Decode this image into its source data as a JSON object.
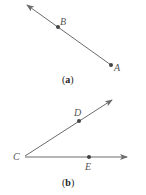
{
  "figures": [
    {
      "id": "a",
      "caption_open": "(",
      "caption_letter": "a",
      "caption_close": ")",
      "description": "Ray from A through B",
      "points": {
        "A": {
          "label": "A"
        },
        "B": {
          "label": "B"
        }
      }
    },
    {
      "id": "b",
      "caption_open": "(",
      "caption_letter": "b",
      "caption_close": ")",
      "description": "Angle with vertex C formed by rays CD and CE",
      "points": {
        "C": {
          "label": "C"
        },
        "D": {
          "label": "D"
        },
        "E": {
          "label": "E"
        }
      }
    }
  ],
  "colors": {
    "line": "#6b6b6b",
    "point": "#444444",
    "label": "#555555"
  }
}
